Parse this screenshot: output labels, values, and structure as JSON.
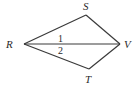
{
  "diagram": {
    "type": "geometry-figure",
    "points": {
      "R": {
        "label": "R",
        "x": 24,
        "y": 44
      },
      "S": {
        "label": "S",
        "x": 86,
        "y": 15
      },
      "V": {
        "label": "V",
        "x": 120,
        "y": 44
      },
      "T": {
        "label": "T",
        "x": 89,
        "y": 69
      }
    },
    "segments": [
      [
        "R",
        "S"
      ],
      [
        "S",
        "V"
      ],
      [
        "R",
        "V"
      ],
      [
        "R",
        "T"
      ],
      [
        "T",
        "V"
      ]
    ],
    "angles": {
      "angle1": {
        "label": "1"
      },
      "angle2": {
        "label": "2"
      }
    },
    "colors": {
      "stroke": "#3a3a3a",
      "text": "#2a2a2a",
      "background": "#ffffff"
    }
  }
}
